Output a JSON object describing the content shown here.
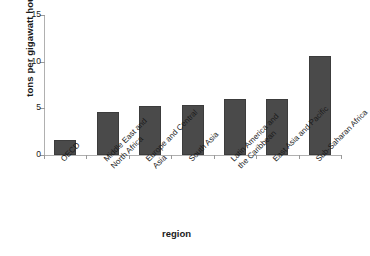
{
  "chart_data": {
    "type": "bar",
    "title": "",
    "xlabel": "region",
    "ylabel": "tons per gigawatt hour",
    "ylim": [
      0,
      15
    ],
    "yticks": [
      0,
      5,
      10,
      15
    ],
    "ytick_labels": [
      "0",
      "5",
      "10",
      "15"
    ],
    "grid": false,
    "legend": null,
    "bar_color": "#4a4a4a",
    "axis_color": "#b0b0b0",
    "categories": [
      "OECD",
      "Middle East and North Africa",
      "Europe and Central Asia",
      "South Asia",
      "Latin America and the Caribbean",
      "East Asia and Pacific",
      "Sub-Saharan Africa"
    ],
    "category_lines": [
      [
        "OECD"
      ],
      [
        "Middle East and",
        "North Africa"
      ],
      [
        "Europe and Central",
        "Asia"
      ],
      [
        "South Asia"
      ],
      [
        "Latin America and",
        "the Caribbean"
      ],
      [
        "East Asia and Pacific"
      ],
      [
        "Sub-Saharan Africa"
      ]
    ],
    "values": [
      1.6,
      4.65,
      5.25,
      5.4,
      6.05,
      6.05,
      10.6
    ]
  },
  "caption": {
    "source": ""
  }
}
